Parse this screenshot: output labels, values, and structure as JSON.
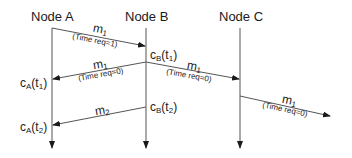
{
  "diagram": {
    "type": "sequence-diagram",
    "nodes": [
      {
        "id": "A",
        "label": "Node A",
        "x": 52
      },
      {
        "id": "B",
        "label": "Node B",
        "x": 146
      },
      {
        "id": "C",
        "label": "Node C",
        "x": 240
      }
    ],
    "messages": [
      {
        "name": "m",
        "sub": "1",
        "req": "(Time req=1)",
        "from": "A",
        "to": "B"
      },
      {
        "name": "m",
        "sub": "1",
        "req": "(Time req=0)",
        "from": "B",
        "to": "A"
      },
      {
        "name": "m",
        "sub": "1",
        "req": "(Time req=0)",
        "from": "B",
        "to": "C"
      },
      {
        "name": "m",
        "sub": "1",
        "req": "(Time req=0)",
        "from": "C",
        "to": "outside"
      },
      {
        "name": "m",
        "sub": "2",
        "req": "",
        "from": "B",
        "to": "A"
      }
    ],
    "clocks": [
      {
        "base": "c",
        "node": "B",
        "time": "t",
        "tsub": "1"
      },
      {
        "base": "c",
        "node": "A",
        "time": "t",
        "tsub": "1"
      },
      {
        "base": "c",
        "node": "B",
        "time": "t",
        "tsub": "2"
      },
      {
        "base": "c",
        "node": "A",
        "time": "t",
        "tsub": "2"
      }
    ],
    "colors": {
      "line": "#555555",
      "text": "#1a1a1a",
      "background": "#ffffff"
    }
  }
}
